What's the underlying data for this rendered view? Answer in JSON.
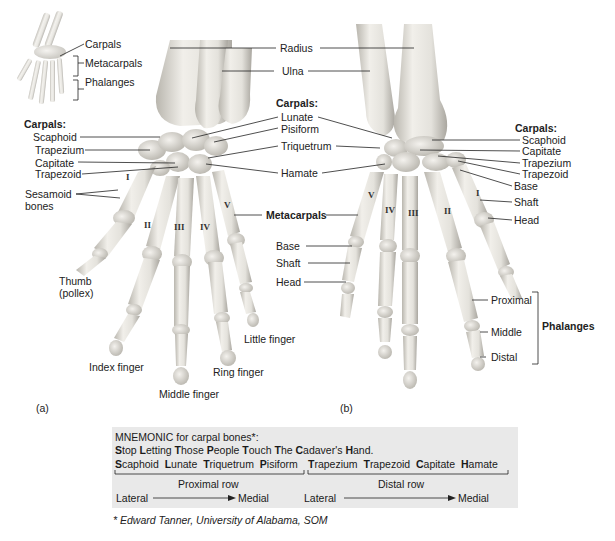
{
  "inset": {
    "labels": [
      "Carpals",
      "Metacarpals",
      "Phalanges"
    ]
  },
  "panel_a": {
    "letter": "(a)",
    "left_heading": "Carpals:",
    "left_carpals": [
      "Scaphoid",
      "Trapezium",
      "Capitate",
      "Trapezoid"
    ],
    "sesamoid": [
      "Sesamoid",
      "bones"
    ],
    "thumb": [
      "Thumb",
      "(pollex)"
    ],
    "fingers": {
      "index": "Index finger",
      "middle": "Middle finger",
      "ring": "Ring finger",
      "little": "Little finger"
    },
    "metacarpal_numerals": [
      "I",
      "II",
      "III",
      "IV",
      "V"
    ]
  },
  "center": {
    "radius": "Radius",
    "ulna": "Ulna",
    "carpals_heading": "Carpals:",
    "carpals": [
      "Lunate",
      "Pisiform",
      "Triquetrum",
      "Hamate"
    ],
    "metacarpals": "Metacarpals",
    "metacarpal_parts": [
      "Base",
      "Shaft",
      "Head"
    ]
  },
  "panel_b": {
    "letter": "(b)",
    "right_heading": "Carpals:",
    "right_carpals": [
      "Scaphoid",
      "Capitate",
      "Trapezium",
      "Trapezoid"
    ],
    "metacarpal_parts": [
      "Base",
      "Shaft",
      "Head"
    ],
    "phalanges_parts": [
      "Proximal",
      "Middle",
      "Distal"
    ],
    "phalanges_heading": "Phalanges",
    "metacarpal_numerals": [
      "V",
      "IV",
      "III",
      "II",
      "I"
    ]
  },
  "mnemonic": {
    "title": "MNEMONIC for carpal bones*:",
    "sentence": [
      {
        "initial": "S",
        "rest": "top"
      },
      {
        "initial": "L",
        "rest": "etting"
      },
      {
        "initial": "T",
        "rest": "hose"
      },
      {
        "initial": "P",
        "rest": "eople"
      },
      {
        "initial": "T",
        "rest": "ouch"
      },
      {
        "initial": "T",
        "rest": "he"
      },
      {
        "initial": "C",
        "rest": "adaver's"
      },
      {
        "initial": "H",
        "rest": "and."
      }
    ],
    "proximal_bones": [
      {
        "initial": "S",
        "rest": "caphoid"
      },
      {
        "initial": "L",
        "rest": "unate"
      },
      {
        "initial": "T",
        "rest": "riquetrum"
      },
      {
        "initial": "P",
        "rest": "isiform"
      }
    ],
    "distal_bones": [
      {
        "initial": "T",
        "rest": "rapezium"
      },
      {
        "initial": "T",
        "rest": "rapezoid"
      },
      {
        "initial": "C",
        "rest": "apitate"
      },
      {
        "initial": "H",
        "rest": "amate"
      }
    ],
    "proximal_row": "Proximal row",
    "distal_row": "Distal row",
    "lateral": "Lateral",
    "medial": "Medial"
  },
  "footnote": "* Edward Tanner, University of Alabama, SOM",
  "colors": {
    "bone": "#e4e2dc",
    "bone_shadow": "#b9b6ae",
    "box_bg": "#e9e9e9",
    "line": "#222222"
  }
}
